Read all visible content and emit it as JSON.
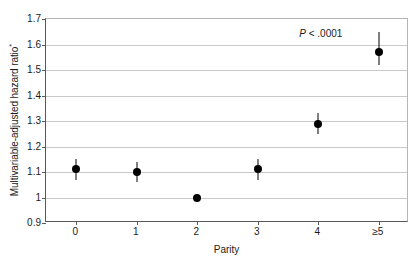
{
  "chart_data": {
    "type": "scatter",
    "title": "",
    "xlabel": "Parity",
    "ylabel": "Multivariable-adjusted hazard ratio*",
    "ylabel_text": "Multivariable-adjusted hazard ratio",
    "ylabel_superscript": "*",
    "categories": [
      "0",
      "1",
      "2",
      "3",
      "4",
      "≥5"
    ],
    "values": [
      1.11,
      1.1,
      1.0,
      1.11,
      1.29,
      1.57
    ],
    "error_low": [
      1.07,
      1.06,
      1.0,
      1.07,
      1.25,
      1.52
    ],
    "error_high": [
      1.15,
      1.14,
      1.0,
      1.15,
      1.33,
      1.65
    ],
    "ylim": [
      0.9,
      1.7
    ],
    "yticks": [
      "0.9",
      "1",
      "1.1",
      "1.2",
      "1.3",
      "1.4",
      "1.5",
      "1.6",
      "1.7"
    ],
    "ytick_values": [
      0.9,
      1.0,
      1.1,
      1.2,
      1.3,
      1.4,
      1.5,
      1.6,
      1.7
    ],
    "grid": true,
    "legend": "none",
    "annotations": [
      {
        "name": "p-value",
        "prefix": "P",
        "text": " < .0001",
        "full_text": "P < .0001"
      }
    ],
    "marker_color": "#000000",
    "errorbar_color": "#000000",
    "gridline_color": "#c9c9c9",
    "axis_color": "#595959",
    "background_color": "#ffffff"
  }
}
